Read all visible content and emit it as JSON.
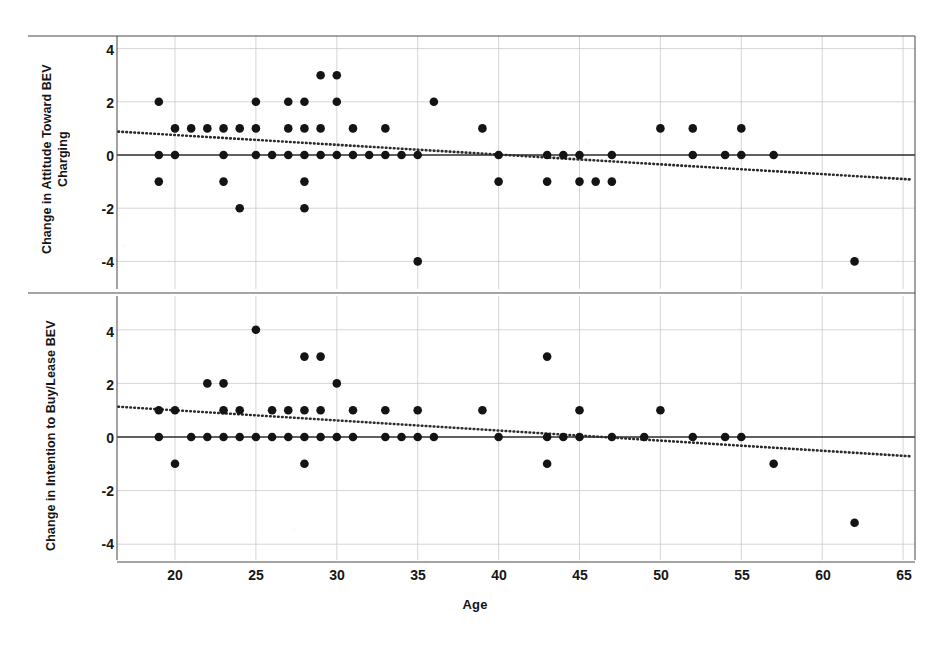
{
  "figure": {
    "xlabel": "Age",
    "panels": [
      {
        "id": "attitude",
        "ylabel_line1": "Change in Attitude Toward BEV",
        "ylabel_line2": "Charging"
      },
      {
        "id": "intention",
        "ylabel_line1": "Change in Intention to Buy/Lease BEV",
        "ylabel_line2": ""
      }
    ],
    "xticks": [
      "20",
      "25",
      "30",
      "35",
      "40",
      "45",
      "50",
      "55",
      "60",
      "65"
    ],
    "yticks": [
      "4",
      "2",
      "0",
      "-2",
      "-4"
    ],
    "colors": {
      "marker": "#141414",
      "axis": "#2b2b2b",
      "grid": "#c9c9c9",
      "trend": "#2b2b2b",
      "background": "#ffffff"
    }
  },
  "chart_data": [
    {
      "type": "scatter",
      "title": "",
      "panel": "attitude",
      "xlabel": "Age",
      "ylabel": "Change in Attitude Toward BEV Charging",
      "xlim": [
        16.5,
        65.5
      ],
      "ylim": [
        -5.0,
        4.6
      ],
      "xticks": [
        20,
        25,
        30,
        35,
        40,
        45,
        50,
        55,
        60,
        65
      ],
      "yticks": [
        4,
        2,
        0,
        -2,
        -4
      ],
      "grid": true,
      "legend": "none",
      "zero_line": 0,
      "trendline": {
        "type": "linear-dotted",
        "x": [
          16.5,
          65.5
        ],
        "y": [
          0.88,
          -0.92
        ],
        "slope": -0.0367,
        "intercept": 1.486
      },
      "points": [
        {
          "x": 19,
          "y": 2
        },
        {
          "x": 19,
          "y": 0
        },
        {
          "x": 19,
          "y": -1
        },
        {
          "x": 20,
          "y": 1
        },
        {
          "x": 20,
          "y": 0
        },
        {
          "x": 21,
          "y": 1
        },
        {
          "x": 22,
          "y": 1
        },
        {
          "x": 23,
          "y": 1
        },
        {
          "x": 23,
          "y": 0
        },
        {
          "x": 23,
          "y": -1
        },
        {
          "x": 24,
          "y": 1
        },
        {
          "x": 24,
          "y": -2
        },
        {
          "x": 25,
          "y": 2
        },
        {
          "x": 25,
          "y": 1
        },
        {
          "x": 25,
          "y": 0
        },
        {
          "x": 26,
          "y": 0
        },
        {
          "x": 27,
          "y": 2
        },
        {
          "x": 27,
          "y": 1
        },
        {
          "x": 27,
          "y": 0
        },
        {
          "x": 28,
          "y": 2
        },
        {
          "x": 28,
          "y": 1
        },
        {
          "x": 28,
          "y": 0
        },
        {
          "x": 28,
          "y": -1
        },
        {
          "x": 28,
          "y": -2
        },
        {
          "x": 29,
          "y": 3
        },
        {
          "x": 29,
          "y": 1
        },
        {
          "x": 29,
          "y": 0
        },
        {
          "x": 30,
          "y": 3
        },
        {
          "x": 30,
          "y": 2
        },
        {
          "x": 30,
          "y": 0
        },
        {
          "x": 31,
          "y": 1
        },
        {
          "x": 31,
          "y": 0
        },
        {
          "x": 32,
          "y": 0
        },
        {
          "x": 33,
          "y": 1
        },
        {
          "x": 33,
          "y": 0
        },
        {
          "x": 34,
          "y": 0
        },
        {
          "x": 35,
          "y": 0
        },
        {
          "x": 35,
          "y": -4
        },
        {
          "x": 36,
          "y": 2
        },
        {
          "x": 39,
          "y": 1
        },
        {
          "x": 40,
          "y": 0
        },
        {
          "x": 40,
          "y": -1
        },
        {
          "x": 43,
          "y": 0
        },
        {
          "x": 43,
          "y": -1
        },
        {
          "x": 44,
          "y": 0
        },
        {
          "x": 45,
          "y": 0
        },
        {
          "x": 45,
          "y": -1
        },
        {
          "x": 46,
          "y": -1
        },
        {
          "x": 47,
          "y": 0
        },
        {
          "x": 47,
          "y": -1
        },
        {
          "x": 50,
          "y": 1
        },
        {
          "x": 52,
          "y": 1
        },
        {
          "x": 52,
          "y": 0
        },
        {
          "x": 54,
          "y": 0
        },
        {
          "x": 55,
          "y": 1
        },
        {
          "x": 55,
          "y": 0
        },
        {
          "x": 57,
          "y": 0
        },
        {
          "x": 62,
          "y": -4
        }
      ]
    },
    {
      "type": "scatter",
      "title": "",
      "panel": "intention",
      "xlabel": "Age",
      "ylabel": "Change in Intention to Buy/Lease BEV",
      "xlim": [
        16.5,
        65.5
      ],
      "ylim": [
        -4.6,
        5.0
      ],
      "xticks": [
        20,
        25,
        30,
        35,
        40,
        45,
        50,
        55,
        60,
        65
      ],
      "yticks": [
        4,
        2,
        0,
        -2,
        -4
      ],
      "grid": true,
      "legend": "none",
      "zero_line": 0,
      "trendline": {
        "type": "linear-dotted",
        "x": [
          16.5,
          65.5
        ],
        "y": [
          1.13,
          -0.72
        ],
        "slope": -0.0378,
        "intercept": 1.754
      },
      "points": [
        {
          "x": 19,
          "y": 1
        },
        {
          "x": 19,
          "y": 0
        },
        {
          "x": 20,
          "y": 1
        },
        {
          "x": 20,
          "y": -1
        },
        {
          "x": 21,
          "y": 0
        },
        {
          "x": 22,
          "y": 2
        },
        {
          "x": 22,
          "y": 0
        },
        {
          "x": 23,
          "y": 2
        },
        {
          "x": 23,
          "y": 1
        },
        {
          "x": 23,
          "y": 0
        },
        {
          "x": 24,
          "y": 1
        },
        {
          "x": 24,
          "y": 0
        },
        {
          "x": 25,
          "y": 4
        },
        {
          "x": 25,
          "y": 0
        },
        {
          "x": 26,
          "y": 1
        },
        {
          "x": 26,
          "y": 0
        },
        {
          "x": 27,
          "y": 1
        },
        {
          "x": 27,
          "y": 0
        },
        {
          "x": 28,
          "y": 3
        },
        {
          "x": 28,
          "y": 1
        },
        {
          "x": 28,
          "y": 0
        },
        {
          "x": 28,
          "y": -1
        },
        {
          "x": 29,
          "y": 3
        },
        {
          "x": 29,
          "y": 1
        },
        {
          "x": 29,
          "y": 0
        },
        {
          "x": 30,
          "y": 2
        },
        {
          "x": 30,
          "y": 0
        },
        {
          "x": 31,
          "y": 1
        },
        {
          "x": 31,
          "y": 0
        },
        {
          "x": 33,
          "y": 1
        },
        {
          "x": 33,
          "y": 0
        },
        {
          "x": 34,
          "y": 0
        },
        {
          "x": 35,
          "y": 1
        },
        {
          "x": 35,
          "y": 0
        },
        {
          "x": 36,
          "y": 0
        },
        {
          "x": 39,
          "y": 1
        },
        {
          "x": 40,
          "y": 0
        },
        {
          "x": 43,
          "y": 3
        },
        {
          "x": 43,
          "y": 0
        },
        {
          "x": 43,
          "y": -1
        },
        {
          "x": 44,
          "y": 0
        },
        {
          "x": 45,
          "y": 1
        },
        {
          "x": 45,
          "y": 0
        },
        {
          "x": 47,
          "y": 0
        },
        {
          "x": 49,
          "y": 0
        },
        {
          "x": 50,
          "y": 1
        },
        {
          "x": 52,
          "y": 0
        },
        {
          "x": 54,
          "y": 0
        },
        {
          "x": 55,
          "y": 0
        },
        {
          "x": 57,
          "y": -1
        },
        {
          "x": 62,
          "y": -3.2
        }
      ]
    }
  ]
}
